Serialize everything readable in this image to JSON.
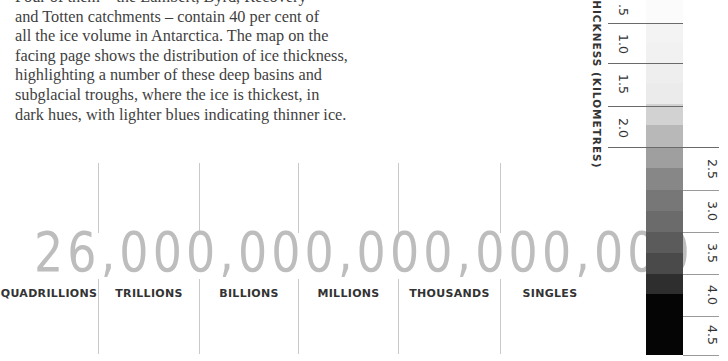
{
  "article": {
    "lines": [
      "Four of them – the Lambert, Byrd, Recovery",
      "and Totten catchments – contain 40 per cent of",
      "all the ice volume in Antarctica. The map on the",
      "facing page shows the distribution of ice thickness,",
      "highlighting a number of these deep basins and",
      "subglacial troughs, where the ice is thickest, in",
      "dark hues, with lighter blues indicating thinner ice."
    ]
  },
  "big_number": {
    "value": "26,000,000,000,000,000",
    "color": "#bdbdbd"
  },
  "place_values": [
    {
      "label": "QUADRILLIONS"
    },
    {
      "label": "TRILLIONS"
    },
    {
      "label": "BILLIONS"
    },
    {
      "label": "MILLIONS"
    },
    {
      "label": "THOUSANDS"
    },
    {
      "label": "SINGLES"
    }
  ],
  "legend": {
    "title": "THICKNESS (KILOMETRES)",
    "left_labels": [
      ".5",
      "1.0",
      "1.5",
      "2.0"
    ],
    "right_labels": [
      "2.5",
      "3.0",
      "3.5",
      "4.0",
      "4.5"
    ],
    "bands": [
      {
        "color": "#fbfbfb"
      },
      {
        "color": "#f3f3f3"
      },
      {
        "color": "#eeeeee"
      },
      {
        "color": "#e9e9e9"
      },
      {
        "color": "#e6e6e6"
      },
      {
        "color": "#d0d0d0"
      },
      {
        "color": "#b7b7b7"
      },
      {
        "color": "#9e9e9e"
      },
      {
        "color": "#868686"
      },
      {
        "color": "#777777"
      },
      {
        "color": "#6a6a6a"
      },
      {
        "color": "#595959"
      },
      {
        "color": "#404040"
      },
      {
        "color": "#0a0a0a"
      },
      {
        "color": "#000000"
      }
    ]
  }
}
